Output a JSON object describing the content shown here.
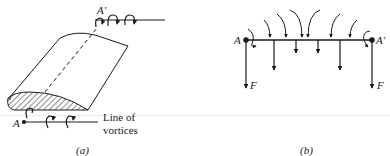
{
  "figure": {
    "panel_a": {
      "caption": "(a)",
      "point_start": "A",
      "point_end": "A′",
      "vortex_line_label_line1": "Line of",
      "vortex_line_label_line2": "vortices",
      "description": "Wing with hatched airfoil cross-section; bound vortex line along span from A to A′ with trailing vortex loops"
    },
    "panel_b": {
      "caption": "(b)",
      "point_start": "A",
      "point_end": "A′",
      "force_label_left": "F",
      "force_label_right": "F",
      "description": "Line A–A′ with incoming circulation arrows and downward force arrows; end forces F at A and A′"
    }
  },
  "colors": {
    "ink": "#1a1a1a",
    "background": "#ffffff"
  }
}
